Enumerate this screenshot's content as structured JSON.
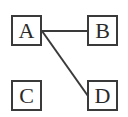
{
  "diagram": {
    "nodes": [
      {
        "id": "A",
        "label": "A",
        "x": 11,
        "y": 15
      },
      {
        "id": "B",
        "label": "B",
        "x": 87,
        "y": 15
      },
      {
        "id": "C",
        "label": "C",
        "x": 11,
        "y": 80
      },
      {
        "id": "D",
        "label": "D",
        "x": 87,
        "y": 80
      }
    ],
    "edges": [
      {
        "from": "A",
        "to": "B"
      },
      {
        "from": "A",
        "to": "D"
      }
    ],
    "colors": {
      "stroke": "#3a3a3a",
      "text": "#2a2a2a",
      "background": "#ffffff"
    }
  }
}
